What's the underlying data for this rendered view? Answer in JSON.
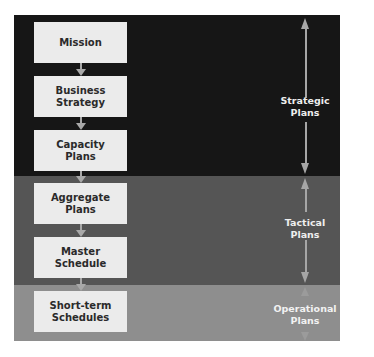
{
  "diagram": {
    "type": "planning-hierarchy",
    "boxes": [
      {
        "lines": [
          "Mission"
        ]
      },
      {
        "lines": [
          "Business",
          "Strategy"
        ]
      },
      {
        "lines": [
          "Capacity",
          "Plans"
        ]
      },
      {
        "lines": [
          "Aggregate",
          "Plans"
        ]
      },
      {
        "lines": [
          "Master",
          "Schedule"
        ]
      },
      {
        "lines": [
          "Short-term",
          "Schedules"
        ]
      }
    ],
    "levels": [
      {
        "lines": [
          "Strategic",
          "Plans"
        ],
        "color": "#161616"
      },
      {
        "lines": [
          "Tactical",
          "Plans"
        ],
        "color": "#555555"
      },
      {
        "lines": [
          "Operational",
          "Plans"
        ],
        "color": "#8e8e8e"
      }
    ],
    "colors": {
      "box_fill": "#ebebeb",
      "box_text": "#2a2a2a",
      "arrow": "#a8a8a8",
      "label_text": "#eeeeee"
    }
  }
}
